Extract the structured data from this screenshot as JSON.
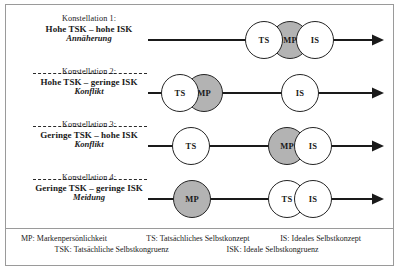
{
  "figure": {
    "rows": [
      {
        "konstellation": "Konstellation 1:",
        "condition": "Hohe TSK – hohe ISK",
        "outcome": "Annäherung",
        "nodes": [
          {
            "label": "TS",
            "fill": "white"
          },
          {
            "label": "MP",
            "fill": "gray"
          },
          {
            "label": "IS",
            "fill": "white"
          }
        ]
      },
      {
        "konstellation": "Konstellation 2:",
        "condition": "Hohe TSK – geringe ISK",
        "outcome": "Konflikt",
        "nodes": [
          {
            "label": "TS",
            "fill": "white"
          },
          {
            "label": "MP",
            "fill": "gray"
          },
          {
            "label": "IS",
            "fill": "white"
          }
        ]
      },
      {
        "konstellation": "Konstellation 3:",
        "condition": "Geringe TSK – hohe ISK",
        "outcome": "Konflikt",
        "nodes": [
          {
            "label": "TS",
            "fill": "white"
          },
          {
            "label": "MP",
            "fill": "gray"
          },
          {
            "label": "IS",
            "fill": "white"
          }
        ]
      },
      {
        "konstellation": "Konstellation 4:",
        "condition": "Geringe TSK – geringe ISK",
        "outcome": "Meidung",
        "nodes": [
          {
            "label": "MP",
            "fill": "gray"
          },
          {
            "label": "TS",
            "fill": "white"
          },
          {
            "label": "IS",
            "fill": "white"
          }
        ]
      }
    ]
  },
  "legend": {
    "line1": [
      "MP: Markenpersönlichkeit",
      "TS: Tatsächliches Selbstkonzept",
      "IS: Ideales Selbstkonzept"
    ],
    "line2": [
      "TSK: Tatsächliche Selbstkongruenz",
      "ISK: Ideale Selbstkongruenz"
    ]
  },
  "colors": {
    "brand_gray": "#b3b3b3",
    "stroke": "#242424",
    "frame": "#9a9a9a"
  }
}
